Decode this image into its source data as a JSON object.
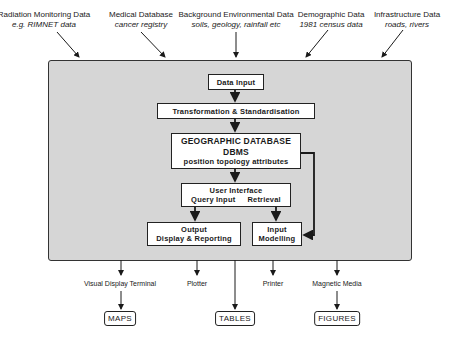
{
  "sources": [
    {
      "title": "Radiation Monitoring Data",
      "subtitle": "e.g. RIMNET data"
    },
    {
      "title": "Medical Database",
      "subtitle": "cancer registry"
    },
    {
      "title": "Background Environmental Data",
      "subtitle": "soils, geology, rainfall etc"
    },
    {
      "title": "Demographic Data",
      "subtitle": "1981 census data"
    },
    {
      "title": "Infrastructure Data",
      "subtitle": "roads, rivers"
    }
  ],
  "system": {
    "data_input": "Data Input",
    "transformation": "Transformation & Standardisation",
    "geodb": {
      "line1": "GEOGRAPHIC DATABASE",
      "line2": "DBMS",
      "line3": "position topology attributes"
    },
    "user_interface": {
      "line1": "User Interface",
      "query": "Query Input",
      "retrieval": "Retrieval"
    },
    "output": {
      "line1": "Output",
      "line2": "Display & Reporting"
    },
    "input_modelling": {
      "line1": "Input",
      "line2": "Modelling"
    }
  },
  "devices": [
    {
      "label": "Visual Display Terminal"
    },
    {
      "label": "Plotter"
    },
    {
      "label": "Printer"
    },
    {
      "label": "Magnetic Media"
    }
  ],
  "products": [
    {
      "label": "MAPS"
    },
    {
      "label": "TABLES"
    },
    {
      "label": "FIGURES"
    }
  ]
}
